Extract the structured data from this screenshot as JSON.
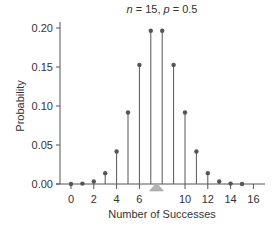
{
  "chart_data": {
    "type": "bar",
    "subtype": "stem",
    "title": "n = 15, p = 0.5",
    "title_parts": {
      "n_label": "n",
      "n_value": "15",
      "p_label": "p",
      "p_value": "0.5"
    },
    "xlabel": "Number of Successes",
    "ylabel": "Probability",
    "x": [
      0,
      1,
      2,
      3,
      4,
      5,
      6,
      7,
      8,
      9,
      10,
      11,
      12,
      13,
      14,
      15
    ],
    "values": [
      3e-05,
      0.0005,
      0.0032,
      0.0139,
      0.0417,
      0.0916,
      0.1527,
      0.1964,
      0.1964,
      0.1527,
      0.0916,
      0.0417,
      0.0139,
      0.0032,
      0.0005,
      3e-05
    ],
    "xticks": [
      0,
      2,
      4,
      6,
      10,
      12,
      14,
      16
    ],
    "xtick_labels": [
      "0",
      "2",
      "4",
      "6",
      "10",
      "12",
      "14",
      "16"
    ],
    "yticks": [
      0.0,
      0.05,
      0.1,
      0.15,
      0.2
    ],
    "ytick_labels": [
      "0.00",
      "0.05",
      "0.10",
      "0.15",
      "0.20"
    ],
    "xlim": [
      -0.5,
      16.5
    ],
    "ylim": [
      0,
      0.2
    ],
    "mean_marker": {
      "x": 7.5,
      "shape": "triangle"
    },
    "grid": false,
    "legend": null
  },
  "colors": {
    "stem": "#555555",
    "marker": "#555555",
    "axis": "#555555",
    "triangle": "#b3b3b3"
  }
}
